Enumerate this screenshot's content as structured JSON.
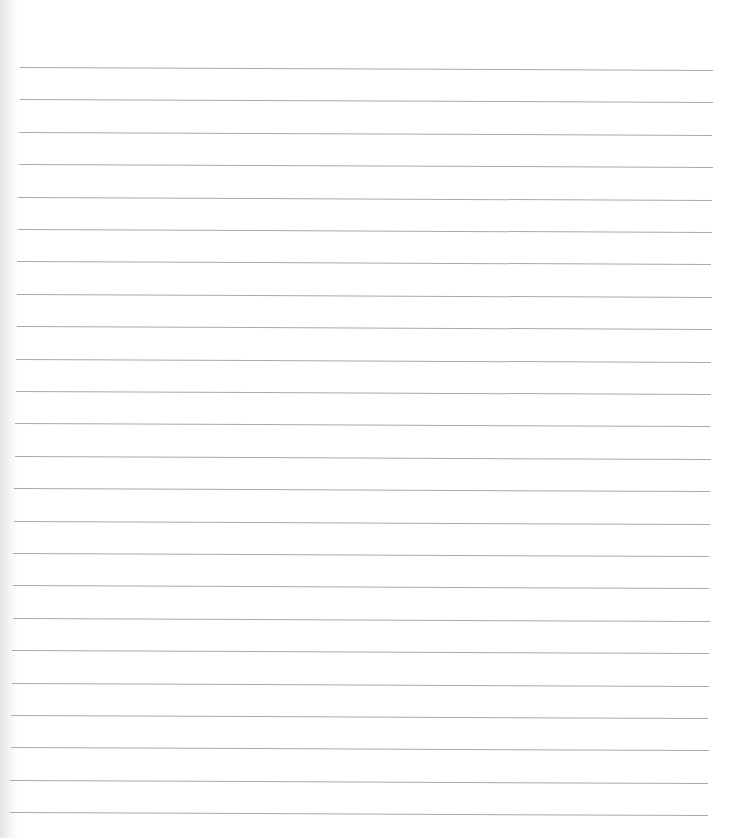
{
  "page": {
    "type": "lined-paper",
    "background_color": "#ffffff",
    "line_color": "#a9a9a9",
    "line_count": 24,
    "first_line_y": 67,
    "line_spacing": 32.4,
    "line_start_x_top": 20,
    "line_start_x_bottom": 10,
    "line_end_x_top": 713,
    "line_end_x_bottom": 708,
    "slope_px": 3
  }
}
